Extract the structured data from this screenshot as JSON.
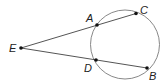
{
  "diagram": {
    "type": "geometry-secants",
    "colors": {
      "line": "#555555",
      "circle": "#888888",
      "point": "#111111",
      "label": "#222222"
    },
    "circle": {
      "cx": 125,
      "cy": 44.5,
      "r": 34.5
    },
    "points": [
      {
        "id": "E",
        "label": "E",
        "x": 21,
        "y": 48,
        "lx": 9,
        "ly": 52
      },
      {
        "id": "A",
        "label": "A",
        "x": 97,
        "y": 25,
        "lx": 86,
        "ly": 22
      },
      {
        "id": "C",
        "label": "C",
        "x": 136,
        "y": 13.5,
        "lx": 140,
        "ly": 14
      },
      {
        "id": "D",
        "label": "D",
        "x": 96,
        "y": 60,
        "lx": 84,
        "ly": 72
      },
      {
        "id": "B",
        "label": "B",
        "x": 147,
        "y": 68,
        "lx": 149,
        "ly": 80
      }
    ],
    "segments": [
      {
        "from": "E",
        "to": "C"
      },
      {
        "from": "E",
        "to": "B"
      }
    ]
  }
}
